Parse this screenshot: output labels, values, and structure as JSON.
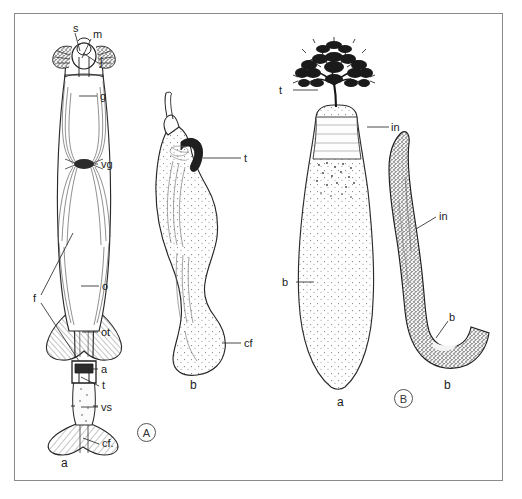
{
  "plate": {
    "background_color": "#ffffff",
    "frame_color": "#8a8a8a",
    "ink_color": "#1c1c1c"
  },
  "panels": [
    {
      "tag": "A",
      "figures": [
        {
          "sublabel": "a",
          "name": "elongate-sheathed-organ",
          "description": "Elongate symmetrical organ with terminal knob, longitudinal fibres and flared basal plate",
          "labels": [
            {
              "code": "s",
              "x": 72,
              "y": 27,
              "tip_x": 79,
              "tip_y": 50
            },
            {
              "code": "m",
              "x": 92,
              "y": 33,
              "tip_x": 81,
              "tip_y": 57
            },
            {
              "code": "j",
              "x": 99,
              "y": 60,
              "tip_x": 82,
              "tip_y": 52
            },
            {
              "code": "g",
              "x": 99,
              "y": 95,
              "tip_x": 78,
              "tip_y": 95
            },
            {
              "code": "vg",
              "x": 100,
              "y": 163,
              "tip_x": 78,
              "tip_y": 163
            },
            {
              "code": "f",
              "x": 32,
              "y": 297,
              "tip_x": 72,
              "tip_y": 232
            },
            {
              "code": "o",
              "x": 101,
              "y": 285,
              "tip_x": 80,
              "tip_y": 285
            },
            {
              "code": "ot",
              "x": 100,
              "y": 331,
              "tip_x": 81,
              "tip_y": 331
            },
            {
              "code": "a",
              "x": 100,
              "y": 368,
              "tip_x": 80,
              "tip_y": 368
            },
            {
              "code": "t",
              "x": 101,
              "y": 383,
              "tip_x": 80,
              "tip_y": 376
            },
            {
              "code": "vs",
              "x": 100,
              "y": 406,
              "tip_x": 80,
              "tip_y": 406
            },
            {
              "code": "cf.",
              "x": 101,
              "y": 441,
              "tip_x": 82,
              "tip_y": 437
            }
          ]
        },
        {
          "sublabel": "b",
          "name": "sinuous-stippled-organ",
          "description": "Sinuous stippled body with hooked apical process and swollen distal end",
          "labels": [
            {
              "code": "t",
              "x": 243,
              "y": 157,
              "tip_x": 202,
              "tip_y": 157
            },
            {
              "code": "cf",
              "x": 243,
              "y": 342,
              "tip_x": 221,
              "tip_y": 342
            }
          ]
        }
      ]
    },
    {
      "tag": "B",
      "figures": [
        {
          "sublabel": "a",
          "name": "bulb-with-arborescent-crown",
          "description": "Tapering stippled bulb crowned by a dense arborescent tuft",
          "labels": [
            {
              "code": "t",
              "x": 278,
              "y": 89,
              "tip_x": 317,
              "tip_y": 89
            },
            {
              "code": "in",
              "x": 390,
              "y": 126,
              "tip_x": 366,
              "tip_y": 126
            },
            {
              "code": "b",
              "x": 281,
              "y": 281,
              "tip_x": 313,
              "tip_y": 281
            }
          ]
        },
        {
          "sublabel": "b",
          "name": "hook-shaped-dark-organ",
          "description": "J-shaped, densely stippled hooked organ",
          "labels": [
            {
              "code": "in",
              "x": 438,
              "y": 215,
              "tip_x": 415,
              "tip_y": 228
            },
            {
              "code": "b",
              "x": 448,
              "y": 316,
              "tip_x": 435,
              "tip_y": 337
            }
          ]
        }
      ]
    }
  ],
  "panel_tags": [
    {
      "label": "A",
      "x": 136,
      "y": 427
    },
    {
      "label": "B",
      "x": 393,
      "y": 393
    }
  ],
  "sublabels": [
    {
      "text": "a",
      "x": 60,
      "y": 461
    },
    {
      "text": "b",
      "x": 189,
      "y": 383
    },
    {
      "text": "a",
      "x": 336,
      "y": 400
    },
    {
      "text": "b",
      "x": 443,
      "y": 383
    }
  ]
}
